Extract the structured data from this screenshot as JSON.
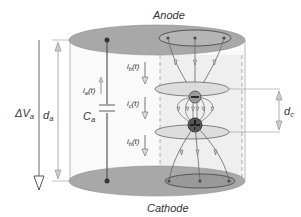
{
  "diagram": {
    "electrodes": {
      "top": "Anode",
      "bottom": "Cathode"
    },
    "left_dimensions": {
      "voltage": {
        "symbol": "ΔV",
        "subscript": "a"
      },
      "gap": {
        "symbol": "d",
        "subscript": "a"
      }
    },
    "circuit": {
      "current": {
        "symbol": "i",
        "subscript": "a",
        "suffix": "(t)"
      },
      "capacitor": {
        "symbol": "C",
        "subscript": "a"
      }
    },
    "channel_currents": [
      {
        "symbol": "i",
        "subscript": "b",
        "suffix": "(t)"
      },
      {
        "symbol": "i",
        "subscript": "c",
        "suffix": "(t)"
      },
      {
        "symbol": "i",
        "subscript": "b",
        "suffix": "(t)"
      }
    ],
    "right_dimension": {
      "symbol": "d",
      "subscript": "c"
    },
    "charges": {
      "negative": "−",
      "positive": "+"
    },
    "colors": {
      "electrode_fill": "#a8a8a8",
      "electrode_stroke": "#777777",
      "line": "#555555",
      "arrow_fill": "#c8c8c8",
      "negative_charge": "#9a9a9a",
      "positive_charge": "#555555",
      "disk_fill": "#d9d9d9"
    }
  }
}
